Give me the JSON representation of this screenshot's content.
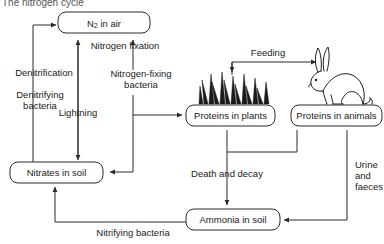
{
  "title": "The nitrogen cycle",
  "diagram": {
    "type": "cycle-flowchart",
    "nodes": [
      {
        "id": "n2_air",
        "label": "N",
        "label_sub": "2",
        "label_rest": " in air",
        "full_label": "N2 in air"
      },
      {
        "id": "nitrates",
        "label": "Nitrates in soil"
      },
      {
        "id": "proteins_plants",
        "label": "Proteins in plants"
      },
      {
        "id": "proteins_animals",
        "label": "Proteins in animals"
      },
      {
        "id": "ammonia",
        "label": "Ammonia in soil"
      }
    ],
    "edges": [
      {
        "id": "denitrification",
        "label": "Denitrification",
        "from": "nitrates",
        "to": "n2_air"
      },
      {
        "id": "denitrifying_bacteria",
        "label_line1": "Denitrifying",
        "label_line2": "bacteria",
        "from": "nitrates",
        "to": "n2_air"
      },
      {
        "id": "lightning",
        "label": "Lightning",
        "from": "n2_air",
        "to": "nitrates",
        "bidirectional": true
      },
      {
        "id": "nitrogen_fixation",
        "label": "Nitrogen fixation",
        "from": "soil",
        "to": "n2_air"
      },
      {
        "id": "nitrogen_fixing_bacteria",
        "label_line1": "Nitrogen-fixing",
        "label_line2": "bacteria",
        "from": "n2_air",
        "to": "proteins_plants"
      },
      {
        "id": "feeding",
        "label": "Feeding",
        "from": "proteins_plants",
        "to": "proteins_animals"
      },
      {
        "id": "death_and_decay",
        "label": "Death and decay",
        "from": "proteins",
        "to": "ammonia"
      },
      {
        "id": "urine_and_faeces",
        "label_line1": "Urine",
        "label_line2": "and",
        "label_line3": "faeces",
        "from": "proteins_animals",
        "to": "ammonia"
      },
      {
        "id": "nitrifying_bacteria",
        "label": "Nitrifying bacteria",
        "from": "ammonia",
        "to": "nitrates"
      }
    ],
    "illustrations": [
      {
        "id": "grass",
        "name": "grass-tuft"
      },
      {
        "id": "rabbit",
        "name": "rabbit"
      }
    ]
  },
  "colors": {
    "line": "#2b2b2b",
    "text": "#1a1a1a",
    "background": "#ffffff",
    "title": "#555555"
  }
}
